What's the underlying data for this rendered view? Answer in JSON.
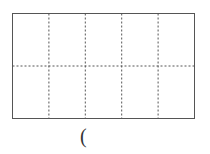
{
  "diagram": {
    "type": "rectangle-grid",
    "columns": 5,
    "rows": 2,
    "outer_border": "solid",
    "inner_lines": "dashed",
    "line_color": "#555555"
  },
  "caption": {
    "text": "("
  }
}
